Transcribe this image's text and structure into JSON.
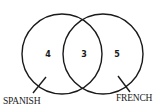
{
  "diagram": {
    "type": "venn",
    "sets": [
      {
        "name": "SPANISH",
        "only_count": "4"
      },
      {
        "name": "FRENCH",
        "only_count": "5"
      }
    ],
    "intersection_count": "3",
    "labels": {
      "spanish": "SPANISH",
      "french": "FRENCH"
    },
    "regions": {
      "spanish_only": "4",
      "both": "3",
      "french_only": "5"
    },
    "colors": {
      "stroke": "#1a1a1a",
      "background": "#ffffff"
    }
  }
}
